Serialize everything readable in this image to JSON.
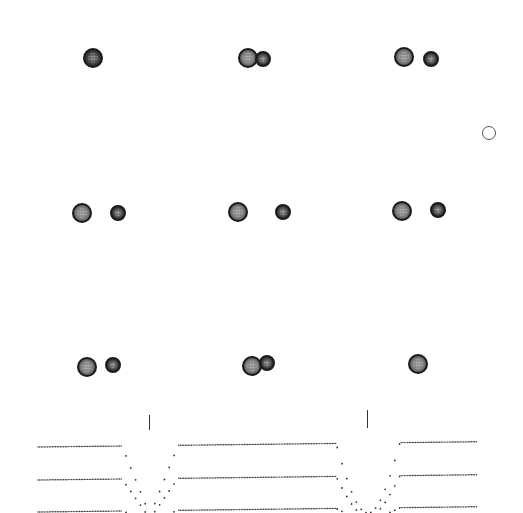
{
  "figure": {
    "colors": {
      "background": "#ffffff",
      "star_edge": "#1a1a1a",
      "curve_dots": "#333333"
    },
    "configurations": [
      {
        "row": 1,
        "col": 1,
        "stars": [
          {
            "type": "single",
            "cx": 93,
            "cy": 58,
            "r": 10
          }
        ]
      },
      {
        "row": 1,
        "col": 2,
        "stars": [
          {
            "type": "primary",
            "cx": 248,
            "cy": 58,
            "r": 10
          },
          {
            "type": "secondary",
            "cx": 263,
            "cy": 59,
            "r": 8
          }
        ]
      },
      {
        "row": 1,
        "col": 3,
        "stars": [
          {
            "type": "primary",
            "cx": 404,
            "cy": 57,
            "r": 10
          },
          {
            "type": "secondary",
            "cx": 431,
            "cy": 59,
            "r": 8
          }
        ]
      },
      {
        "row": 2,
        "col": 1,
        "stars": [
          {
            "type": "primary",
            "cx": 82,
            "cy": 213,
            "r": 10
          },
          {
            "type": "secondary",
            "cx": 118,
            "cy": 213,
            "r": 8
          }
        ]
      },
      {
        "row": 2,
        "col": 2,
        "stars": [
          {
            "type": "primary",
            "cx": 238,
            "cy": 212,
            "r": 10
          },
          {
            "type": "secondary",
            "cx": 283,
            "cy": 212,
            "r": 8
          }
        ]
      },
      {
        "row": 2,
        "col": 3,
        "stars": [
          {
            "type": "primary",
            "cx": 402,
            "cy": 211,
            "r": 10
          },
          {
            "type": "secondary",
            "cx": 438,
            "cy": 210,
            "r": 8
          }
        ]
      },
      {
        "row": 3,
        "col": 1,
        "stars": [
          {
            "type": "primary",
            "cx": 87,
            "cy": 367,
            "r": 10
          },
          {
            "type": "secondary",
            "cx": 113,
            "cy": 365,
            "r": 8
          }
        ]
      },
      {
        "row": 3,
        "col": 2,
        "stars": [
          {
            "type": "primary",
            "cx": 252,
            "cy": 366,
            "r": 10
          },
          {
            "type": "secondary",
            "cx": 267,
            "cy": 363,
            "r": 8
          }
        ]
      },
      {
        "row": 3,
        "col": 3,
        "stars": [
          {
            "type": "primary",
            "cx": 418,
            "cy": 364,
            "r": 10
          }
        ]
      }
    ],
    "reference_marker": {
      "cx": 489,
      "cy": 133,
      "r": 7
    },
    "eclipse_ticks": [
      {
        "x": 149,
        "y1": 415,
        "y2": 430
      },
      {
        "x": 367,
        "y1": 410,
        "y2": 428
      }
    ]
  },
  "chart_data": {
    "type": "scatter",
    "title": "",
    "xlabel": "",
    "ylabel": "",
    "grid": false,
    "legend": null,
    "note": "Three offset dotted light curves showing two eclipse minima (primary near x=150, secondary near x=368); pixel coordinates, lower flux = larger y",
    "eclipse_centers_px": [
      150,
      368
    ],
    "series": [
      {
        "name": "curve-1",
        "baseline_y": 447,
        "x_range": [
          38,
          478
        ],
        "dip_depth_px": 70
      },
      {
        "name": "curve-2",
        "baseline_y": 480,
        "x_range": [
          38,
          478
        ],
        "dip_depth_px": 40
      },
      {
        "name": "curve-3",
        "baseline_y": 512,
        "x_range": [
          38,
          478
        ],
        "dip_depth_px": 10
      }
    ]
  }
}
